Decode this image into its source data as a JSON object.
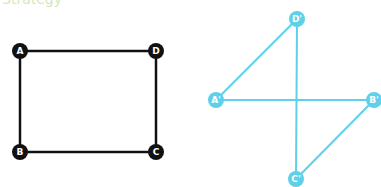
{
  "header": {
    "cut_text": "Strategy"
  },
  "colors": {
    "original": "#111111",
    "transformed": "#5fd0ea"
  },
  "original_square": {
    "vertices": [
      {
        "label": "A",
        "x": 20,
        "y": 51
      },
      {
        "label": "D",
        "x": 156,
        "y": 51
      },
      {
        "label": "C",
        "x": 156,
        "y": 152
      },
      {
        "label": "B",
        "x": 20,
        "y": 152
      }
    ],
    "edges": [
      [
        "A",
        "D"
      ],
      [
        "D",
        "C"
      ],
      [
        "C",
        "B"
      ],
      [
        "B",
        "A"
      ]
    ]
  },
  "transformed_figure": {
    "vertices": [
      {
        "label": "A'",
        "x": 216,
        "y": 100
      },
      {
        "label": "B'",
        "x": 374,
        "y": 100
      },
      {
        "label": "C'",
        "x": 296,
        "y": 179
      },
      {
        "label": "D'",
        "x": 297,
        "y": 19
      }
    ],
    "edges": [
      [
        "A'",
        "D'"
      ],
      [
        "D'",
        "C'"
      ],
      [
        "A'",
        "B'"
      ],
      [
        "B'",
        "C'"
      ]
    ]
  }
}
